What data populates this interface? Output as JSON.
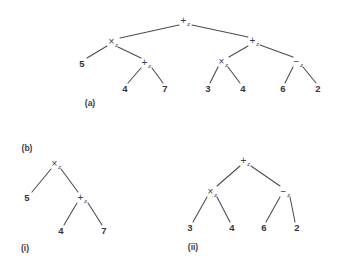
{
  "figure": {
    "background_color": "#ffffff",
    "ink_color": "#3c3c46",
    "edge_color": "#4a4a52",
    "captions": [
      {
        "id": "caption-a",
        "label": "(a)",
        "x": 90,
        "y": 103
      },
      {
        "id": "caption-b",
        "label": "(b)",
        "x": 27,
        "y": 148
      },
      {
        "id": "caption-i",
        "label": "(i)",
        "x": 25,
        "y": 248
      },
      {
        "id": "caption-ii",
        "label": "(ii)",
        "x": 193,
        "y": 247
      }
    ]
  },
  "trees": [
    {
      "id": "tree-a",
      "caption": "(a)",
      "nodes": [
        {
          "id": "a-n0",
          "kind": "op",
          "symbol": "+",
          "subscript": "z",
          "text": "+z",
          "x": 185,
          "y": 21
        },
        {
          "id": "a-n1",
          "kind": "op",
          "symbol": "×",
          "subscript": "z",
          "text": "×z",
          "x": 113,
          "y": 42
        },
        {
          "id": "a-n2",
          "kind": "op",
          "symbol": "+",
          "subscript": "z",
          "text": "+z",
          "x": 254,
          "y": 41
        },
        {
          "id": "a-n3",
          "kind": "leaf",
          "text": "5",
          "x": 82,
          "y": 64
        },
        {
          "id": "a-n4",
          "kind": "op",
          "symbol": "+",
          "subscript": "z",
          "text": "+z",
          "x": 146,
          "y": 63
        },
        {
          "id": "a-n5",
          "kind": "op",
          "symbol": "×",
          "subscript": "z",
          "text": "×z",
          "x": 223,
          "y": 62
        },
        {
          "id": "a-n6",
          "kind": "op",
          "symbol": "−",
          "subscript": "z",
          "text": "−z",
          "x": 298,
          "y": 62
        },
        {
          "id": "a-n7",
          "kind": "leaf",
          "text": "4",
          "x": 125,
          "y": 89
        },
        {
          "id": "a-n8",
          "kind": "leaf",
          "text": "7",
          "x": 165,
          "y": 89
        },
        {
          "id": "a-n9",
          "kind": "leaf",
          "text": "3",
          "x": 208,
          "y": 89
        },
        {
          "id": "a-n10",
          "kind": "leaf",
          "text": "4",
          "x": 243,
          "y": 89
        },
        {
          "id": "a-n11",
          "kind": "leaf",
          "text": "6",
          "x": 283,
          "y": 89
        },
        {
          "id": "a-n12",
          "kind": "leaf",
          "text": "2",
          "x": 318,
          "y": 89
        }
      ],
      "edges": [
        {
          "from": "a-n0",
          "to": "a-n1",
          "x1": 179,
          "y1": 25,
          "x2": 120,
          "y2": 38
        },
        {
          "from": "a-n0",
          "to": "a-n2",
          "x1": 192,
          "y1": 25,
          "x2": 248,
          "y2": 37
        },
        {
          "from": "a-n1",
          "to": "a-n3",
          "x1": 107,
          "y1": 46,
          "x2": 87,
          "y2": 58
        },
        {
          "from": "a-n1",
          "to": "a-n4",
          "x1": 118,
          "y1": 47,
          "x2": 141,
          "y2": 58
        },
        {
          "from": "a-n4",
          "to": "a-n7",
          "x1": 141,
          "y1": 68,
          "x2": 128,
          "y2": 83
        },
        {
          "from": "a-n4",
          "to": "a-n8",
          "x1": 152,
          "y1": 68,
          "x2": 163,
          "y2": 83
        },
        {
          "from": "a-n2",
          "to": "a-n5",
          "x1": 248,
          "y1": 46,
          "x2": 229,
          "y2": 57
        },
        {
          "from": "a-n2",
          "to": "a-n6",
          "x1": 260,
          "y1": 45,
          "x2": 293,
          "y2": 57
        },
        {
          "from": "a-n5",
          "to": "a-n9",
          "x1": 218,
          "y1": 67,
          "x2": 210,
          "y2": 83
        },
        {
          "from": "a-n5",
          "to": "a-n10",
          "x1": 228,
          "y1": 67,
          "x2": 240,
          "y2": 83
        },
        {
          "from": "a-n6",
          "to": "a-n11",
          "x1": 293,
          "y1": 67,
          "x2": 285,
          "y2": 83
        },
        {
          "from": "a-n6",
          "to": "a-n12",
          "x1": 303,
          "y1": 67,
          "x2": 316,
          "y2": 83
        }
      ]
    },
    {
      "id": "tree-b-i",
      "caption": "(i)",
      "nodes": [
        {
          "id": "i-n0",
          "kind": "op",
          "symbol": "×",
          "subscript": "z",
          "text": "×z",
          "x": 56,
          "y": 164
        },
        {
          "id": "i-n1",
          "kind": "leaf",
          "text": "5",
          "x": 27,
          "y": 198
        },
        {
          "id": "i-n2",
          "kind": "op",
          "symbol": "+",
          "subscript": "z",
          "text": "+z",
          "x": 82,
          "y": 198
        },
        {
          "id": "i-n3",
          "kind": "leaf",
          "text": "4",
          "x": 61,
          "y": 231
        },
        {
          "id": "i-n4",
          "kind": "leaf",
          "text": "7",
          "x": 104,
          "y": 231
        }
      ],
      "edges": [
        {
          "from": "i-n0",
          "to": "i-n1",
          "x1": 51,
          "y1": 169,
          "x2": 32,
          "y2": 192
        },
        {
          "from": "i-n0",
          "to": "i-n2",
          "x1": 61,
          "y1": 169,
          "x2": 78,
          "y2": 192
        },
        {
          "from": "i-n2",
          "to": "i-n3",
          "x1": 77,
          "y1": 203,
          "x2": 64,
          "y2": 225
        },
        {
          "from": "i-n2",
          "to": "i-n4",
          "x1": 88,
          "y1": 203,
          "x2": 102,
          "y2": 225
        }
      ]
    },
    {
      "id": "tree-b-ii",
      "caption": "(ii)",
      "nodes": [
        {
          "id": "ii-n0",
          "kind": "op",
          "symbol": "+",
          "subscript": "z",
          "text": "+z",
          "x": 245,
          "y": 161
        },
        {
          "id": "ii-n1",
          "kind": "op",
          "symbol": "×",
          "subscript": "z",
          "text": "×z",
          "x": 212,
          "y": 192
        },
        {
          "id": "ii-n2",
          "kind": "op",
          "symbol": "−",
          "subscript": "z",
          "text": "−z",
          "x": 285,
          "y": 192
        },
        {
          "id": "ii-n3",
          "kind": "leaf",
          "text": "3",
          "x": 190,
          "y": 228
        },
        {
          "id": "ii-n4",
          "kind": "leaf",
          "text": "4",
          "x": 232,
          "y": 228
        },
        {
          "id": "ii-n5",
          "kind": "leaf",
          "text": "6",
          "x": 264,
          "y": 228
        },
        {
          "id": "ii-n6",
          "kind": "leaf",
          "text": "2",
          "x": 297,
          "y": 228
        }
      ],
      "edges": [
        {
          "from": "ii-n0",
          "to": "ii-n1",
          "x1": 240,
          "y1": 166,
          "x2": 217,
          "y2": 186
        },
        {
          "from": "ii-n0",
          "to": "ii-n2",
          "x1": 251,
          "y1": 166,
          "x2": 280,
          "y2": 186
        },
        {
          "from": "ii-n1",
          "to": "ii-n3",
          "x1": 207,
          "y1": 197,
          "x2": 193,
          "y2": 222
        },
        {
          "from": "ii-n1",
          "to": "ii-n4",
          "x1": 217,
          "y1": 197,
          "x2": 230,
          "y2": 222
        },
        {
          "from": "ii-n2",
          "to": "ii-n5",
          "x1": 280,
          "y1": 197,
          "x2": 266,
          "y2": 222
        },
        {
          "from": "ii-n2",
          "to": "ii-n6",
          "x1": 290,
          "y1": 197,
          "x2": 295,
          "y2": 222
        }
      ]
    }
  ]
}
